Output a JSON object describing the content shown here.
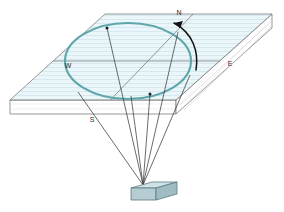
{
  "figure": {
    "labels": {
      "north": "N",
      "south": "S",
      "west": "W",
      "east": "E"
    },
    "colors": {
      "plane_fill": "#eaf6f9",
      "plane_hatch": "#cfe6ec",
      "plane_edge": "#6b6b6b",
      "slab_side_fill": "#ffffff",
      "circle_stroke": "#5fa6ab",
      "ray_stroke": "#3a3a3a",
      "axis_stroke": "#6b6b6b",
      "arrow_stroke": "#111111",
      "device_top": "#cfe2e6",
      "device_front": "#b4ccd2",
      "device_side": "#9fbcc4",
      "device_edge": "#5a7a82",
      "marker_fill": "#1b1b1b"
    },
    "geometry": {
      "plane_corners": [
        {
          "name": "left",
          "x": 10,
          "y": 100
        },
        {
          "name": "back",
          "x": 105,
          "y": 14
        },
        {
          "name": "right",
          "x": 272,
          "y": 14
        },
        {
          "name": "front",
          "x": 176,
          "y": 100
        }
      ],
      "slab_thickness_px": 14,
      "circle_center": {
        "x": 128,
        "y": 61
      },
      "circle_radius": {
        "rx": 63,
        "ry": 38
      },
      "device": {
        "x": 143,
        "y": 188,
        "width": 34,
        "height": 12
      },
      "apex": {
        "x": 143,
        "y": 185
      },
      "ray_targets": [
        {
          "x": 78,
          "y": 92,
          "marked": false
        },
        {
          "x": 107,
          "y": 28,
          "marked": true
        },
        {
          "x": 131,
          "y": 96,
          "marked": false
        },
        {
          "x": 150,
          "y": 94,
          "marked": true
        },
        {
          "x": 178,
          "y": 32,
          "marked": false
        },
        {
          "x": 190,
          "y": 75,
          "marked": false
        }
      ],
      "rotation_arrow": {
        "from": {
          "x": 196,
          "y": 68
        },
        "to": {
          "x": 172,
          "y": 22
        },
        "direction": "counterclockwise-toward-north"
      }
    }
  }
}
